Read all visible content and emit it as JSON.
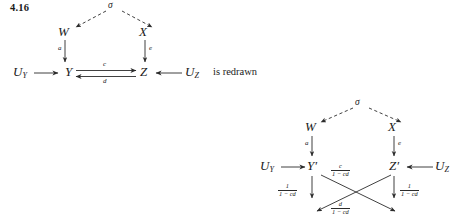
{
  "page": {
    "background": "#ffffff",
    "ink_color": "#2b2b2b",
    "exercise_number": "4.16",
    "connective_text": "is redrawn"
  },
  "diagram_original": {
    "name": "original-commutative-diagram",
    "apex_label": "σ",
    "nodes": {
      "apex": "σ",
      "upper_left": "W",
      "upper_right": "X",
      "source_left": "U",
      "source_left_sub": "Y",
      "mid_left": "Y",
      "mid_right": "Z",
      "source_right": "U",
      "source_right_sub": "Z"
    },
    "edges": [
      {
        "name": "sigma-to-W",
        "label": "",
        "style": "dashed",
        "from": "σ",
        "to": "W"
      },
      {
        "name": "sigma-to-X",
        "label": "",
        "style": "dashed",
        "from": "σ",
        "to": "X"
      },
      {
        "name": "W-to-Y",
        "label": "a",
        "style": "solid",
        "from": "W",
        "to": "Y"
      },
      {
        "name": "X-to-Z",
        "label": "e",
        "style": "solid",
        "from": "X",
        "to": "Z"
      },
      {
        "name": "UY-to-Y",
        "label": "",
        "style": "solid",
        "from": "U_Y",
        "to": "Y"
      },
      {
        "name": "Y-to-Z",
        "label": "c",
        "style": "solid",
        "from": "Y",
        "to": "Z"
      },
      {
        "name": "Z-to-Y",
        "label": "d",
        "style": "solid",
        "from": "Z",
        "to": "Y"
      },
      {
        "name": "UZ-to-Z",
        "label": "",
        "style": "solid",
        "from": "U_Z",
        "to": "Z"
      }
    ]
  },
  "diagram_redrawn": {
    "name": "redrawn-commutative-diagram",
    "apex_label": "σ",
    "nodes": {
      "apex": "σ",
      "upper_left": "W",
      "upper_right": "X",
      "source_left": "U",
      "source_left_sub": "Y",
      "mid_left": "Y",
      "mid_left_prime": "′",
      "mid_right": "Z",
      "mid_right_prime": "′",
      "source_right": "U",
      "source_right_sub": "Z"
    },
    "edges": [
      {
        "name": "sigma-to-W",
        "label": "",
        "style": "dashed"
      },
      {
        "name": "sigma-to-X",
        "label": "",
        "style": "dashed"
      },
      {
        "name": "W-to-Yprime",
        "label": "a",
        "style": "solid"
      },
      {
        "name": "X-to-Zprime",
        "label": "e",
        "style": "solid"
      },
      {
        "name": "UY-to-Yprime",
        "label": "",
        "style": "solid"
      },
      {
        "name": "UZ-to-Zprime",
        "label": "",
        "style": "solid"
      }
    ],
    "fraction_labels": {
      "left_vertical": {
        "numerator": "1",
        "denominator": "1 − cd"
      },
      "right_vertical": {
        "numerator": "1",
        "denominator": "1 − cd"
      },
      "diagonal_down_right": {
        "numerator": "c",
        "denominator": "1 − cd"
      },
      "diagonal_down_left": {
        "numerator": "d",
        "denominator": "1 − cd"
      }
    }
  }
}
